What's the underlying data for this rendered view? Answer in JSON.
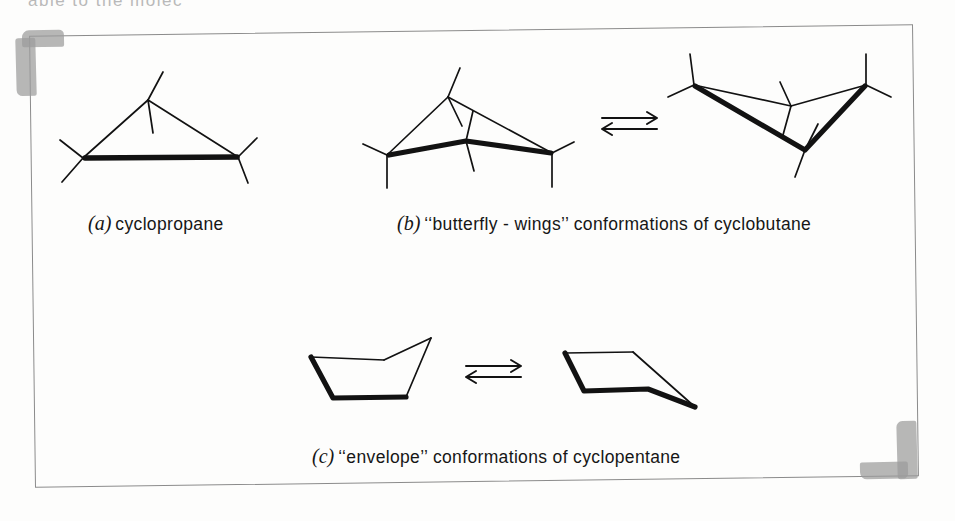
{
  "page": {
    "top_cut_text": "able to the molec",
    "background_color": "#fdfdfc",
    "ink_color": "#121212",
    "tape_color": "#9b9b9b",
    "frame_color": "#8b8b8b"
  },
  "captions": {
    "a": {
      "tag": "(a)",
      "text": "cyclopropane"
    },
    "b": {
      "tag": "(b)",
      "text": "‘‘butterfly - wings’’ conformations of cyclobutane"
    },
    "c": {
      "tag": "(c)",
      "text": "‘‘envelope’’ conformations of cyclopentane"
    }
  },
  "equilibrium_arrows": [
    {
      "name": "cyclobutane-equilibrium-arrow",
      "symbol": "⇌"
    },
    {
      "name": "cyclopentane-equilibrium-arrow",
      "symbol": "⇌"
    }
  ],
  "structures": [
    {
      "id": "cyclopropane",
      "label": "cyclopropane",
      "ring_size": 3,
      "carbons": 3,
      "bold_bonds": 1,
      "description": "planar three-membered ring drawn in perspective, front C-C bond bold"
    },
    {
      "id": "cyclobutane-butterfly-up",
      "label": "butterfly-wings conformation of cyclobutane (folded up)",
      "ring_size": 4,
      "carbons": 4,
      "bold_bonds": 2,
      "description": "puckered four-membered ring, front two bonds bold, fold apex toward viewer"
    },
    {
      "id": "cyclobutane-butterfly-down",
      "label": "butterfly-wings conformation of cyclobutane (folded down)",
      "ring_size": 4,
      "carbons": 4,
      "bold_bonds": 2,
      "description": "inverted pucker of the four-membered ring, front two bonds bold"
    },
    {
      "id": "cyclopentane-envelope-left",
      "label": "envelope conformation of cyclopentane",
      "ring_size": 5,
      "carbons": 5,
      "bold_bonds": 2,
      "description": "five-membered ring with one carbon raised out of plane, flap to the upper right"
    },
    {
      "id": "cyclopentane-envelope-right",
      "label": "envelope conformation of cyclopentane",
      "ring_size": 5,
      "carbons": 5,
      "bold_bonds": 2,
      "description": "five-membered ring with flap extending to the lower right"
    }
  ]
}
